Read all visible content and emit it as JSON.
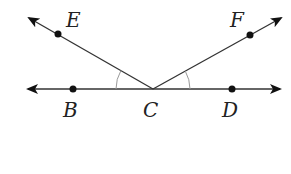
{
  "diagram": {
    "type": "geometry-angles",
    "vertex": {
      "label": "C",
      "x": 153,
      "y": 89
    },
    "points": [
      {
        "label": "B",
        "x": 73,
        "y": 89,
        "label_x": 63,
        "label_y": 117
      },
      {
        "label": "C",
        "x": 153,
        "y": 89,
        "label_x": 143,
        "label_y": 117
      },
      {
        "label": "D",
        "x": 232,
        "y": 89,
        "label_x": 222,
        "label_y": 117
      },
      {
        "label": "E",
        "x": 58,
        "y": 34,
        "label_x": 66,
        "label_y": 27
      },
      {
        "label": "F",
        "x": 250,
        "y": 35,
        "label_x": 230,
        "label_y": 27
      }
    ],
    "rays": [
      {
        "name": "CB",
        "from": "C",
        "toward": "B"
      },
      {
        "name": "CD",
        "from": "C",
        "toward": "D"
      },
      {
        "name": "CE",
        "from": "C",
        "toward": "E"
      },
      {
        "name": "CF",
        "from": "C",
        "toward": "F"
      }
    ],
    "angle_marks": [
      {
        "angle": "ECB",
        "single_arc": true
      },
      {
        "angle": "FCD",
        "single_arc": true
      }
    ],
    "colors": {
      "line": "#333333",
      "arc": "#999999",
      "dot": "#111111"
    }
  }
}
